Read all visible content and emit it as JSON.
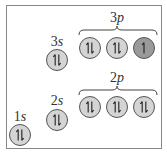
{
  "diagram": {
    "subshells": [
      {
        "label_n": "1",
        "label_l": "s",
        "orbitals": [
          "paired"
        ]
      },
      {
        "label_n": "2",
        "label_l": "s",
        "orbitals": [
          "paired"
        ]
      },
      {
        "label_n": "3",
        "label_l": "s",
        "orbitals": [
          "paired"
        ]
      },
      {
        "label_n": "2",
        "label_l": "p",
        "orbitals": [
          "paired",
          "paired",
          "paired"
        ]
      },
      {
        "label_n": "3",
        "label_l": "p",
        "orbitals": [
          "paired",
          "paired",
          "single"
        ]
      }
    ],
    "colors": {
      "filled": "#d4d4d4",
      "half_filled": "#9a9a9a",
      "outline": "#555555"
    }
  }
}
